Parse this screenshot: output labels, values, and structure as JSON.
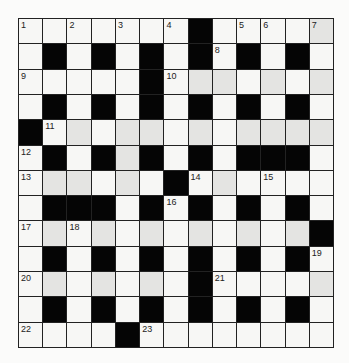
{
  "puzzle": {
    "type": "crossword",
    "rows": 13,
    "cols": 13,
    "legend": {
      "#": "black square",
      ".": "white square",
      "+": "white square (shaded)"
    },
    "grid": [
      ".......#....+",
      ".#.#.#.#.#.#.",
      ".....#.++.+.+",
      ".#.#.#.#.#.#.",
      "#.+.++.+.++++",
      ".#.#+#.#.###.",
      ".++.+.#.+....",
      ".###.#.#.#.#.",
      ".+.+.+.+.+.+#",
      ".#.#.#.#.#.#.",
      ".+.+.+.#....+",
      ".#.#.#.#.#.#.",
      "....#........"
    ],
    "numbers": [
      {
        "n": "1",
        "r": 0,
        "c": 0
      },
      {
        "n": "2",
        "r": 0,
        "c": 2
      },
      {
        "n": "3",
        "r": 0,
        "c": 4
      },
      {
        "n": "4",
        "r": 0,
        "c": 6
      },
      {
        "n": "5",
        "r": 0,
        "c": 9
      },
      {
        "n": "6",
        "r": 0,
        "c": 10
      },
      {
        "n": "7",
        "r": 0,
        "c": 12
      },
      {
        "n": "8",
        "r": 1,
        "c": 8
      },
      {
        "n": "9",
        "r": 2,
        "c": 0
      },
      {
        "n": "10",
        "r": 2,
        "c": 6
      },
      {
        "n": "11",
        "r": 4,
        "c": 1
      },
      {
        "n": "12",
        "r": 5,
        "c": 0
      },
      {
        "n": "13",
        "r": 6,
        "c": 0
      },
      {
        "n": "14",
        "r": 6,
        "c": 7
      },
      {
        "n": "15",
        "r": 6,
        "c": 10
      },
      {
        "n": "16",
        "r": 7,
        "c": 6
      },
      {
        "n": "17",
        "r": 8,
        "c": 0
      },
      {
        "n": "18",
        "r": 8,
        "c": 2
      },
      {
        "n": "19",
        "r": 9,
        "c": 12
      },
      {
        "n": "20",
        "r": 10,
        "c": 0
      },
      {
        "n": "21",
        "r": 10,
        "c": 8
      },
      {
        "n": "22",
        "r": 12,
        "c": 0
      },
      {
        "n": "23",
        "r": 12,
        "c": 5
      }
    ],
    "colors": {
      "block": "#050505",
      "white": "#f7f7f5",
      "shade": "#e4e4e2",
      "grid_line": "#222222"
    }
  }
}
